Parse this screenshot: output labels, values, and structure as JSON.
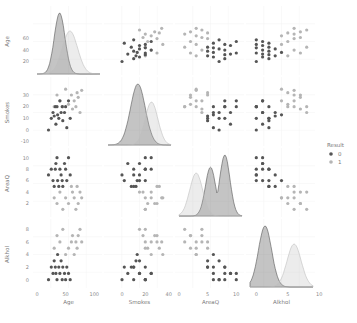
{
  "chart_data": {
    "type": "pairplot",
    "title": "",
    "variables": [
      "Age",
      "Smokes",
      "AreaQ",
      "Alkhol"
    ],
    "hue": "Result",
    "legend": {
      "title": "Result",
      "position": "right",
      "entries": [
        {
          "label": "0",
          "color": "#555555"
        },
        {
          "label": "1",
          "color": "#b5b5b5"
        }
      ]
    },
    "axes": {
      "Age": {
        "range": [
          0,
          110
        ],
        "ticks": [
          0,
          50,
          100
        ],
        "y_ticks": [
          20,
          40,
          60
        ]
      },
      "Smokes": {
        "range": [
          -12,
          42
        ],
        "ticks": [
          0,
          20,
          40
        ],
        "y_ticks": [
          -10,
          0,
          10,
          20,
          30
        ]
      },
      "AreaQ": {
        "range": [
          0,
          11
        ],
        "ticks": [
          0,
          5,
          10
        ],
        "y_ticks": [
          2,
          4,
          6,
          8,
          10
        ]
      },
      "Alkhol": {
        "range": [
          -1,
          9
        ],
        "ticks": [
          0,
          5,
          10
        ],
        "y_ticks": [
          0,
          2,
          4,
          6,
          8
        ]
      }
    },
    "grid": true,
    "diagonal": "kde",
    "offdiagonal": "scatter",
    "series": [
      {
        "name": "0",
        "points": [
          {
            "Age": 20,
            "Smokes": 0,
            "AreaQ": 7,
            "Alkhol": 0
          },
          {
            "Age": 25,
            "Smokes": 10,
            "AreaQ": 8,
            "Alkhol": 2
          },
          {
            "Age": 28,
            "Smokes": 15,
            "AreaQ": 6,
            "Alkhol": 1
          },
          {
            "Age": 30,
            "Smokes": 12,
            "AreaQ": 5,
            "Alkhol": 3
          },
          {
            "Age": 32,
            "Smokes": 20,
            "AreaQ": 8,
            "Alkhol": 2
          },
          {
            "Age": 33,
            "Smokes": 5,
            "AreaQ": 9,
            "Alkhol": 1
          },
          {
            "Age": 35,
            "Smokes": 20,
            "AreaQ": 10,
            "Alkhol": 0
          },
          {
            "Age": 36,
            "Smokes": 13,
            "AreaQ": 6,
            "Alkhol": 4
          },
          {
            "Age": 38,
            "Smokes": 10,
            "AreaQ": 5,
            "Alkhol": 2
          },
          {
            "Age": 40,
            "Smokes": 25,
            "AreaQ": 8,
            "Alkhol": 1
          },
          {
            "Age": 42,
            "Smokes": 15,
            "AreaQ": 7,
            "Alkhol": 3
          },
          {
            "Age": 44,
            "Smokes": 20,
            "AreaQ": 6,
            "Alkhol": 0
          },
          {
            "Age": 45,
            "Smokes": 8,
            "AreaQ": 5,
            "Alkhol": 2
          },
          {
            "Age": 48,
            "Smokes": 15,
            "AreaQ": 9,
            "Alkhol": 1
          },
          {
            "Age": 50,
            "Smokes": 20,
            "AreaQ": 8,
            "Alkhol": 0
          },
          {
            "Age": 52,
            "Smokes": 2,
            "AreaQ": 6,
            "Alkhol": 2
          },
          {
            "Age": 55,
            "Smokes": 25,
            "AreaQ": 10,
            "Alkhol": 1
          },
          {
            "Age": 58,
            "Smokes": 10,
            "AreaQ": 7,
            "Alkhol": 0
          }
        ]
      },
      {
        "name": "1",
        "points": [
          {
            "Age": 30,
            "Smokes": 20,
            "AreaQ": 3,
            "Alkhol": 5
          },
          {
            "Age": 35,
            "Smokes": 30,
            "AreaQ": 2,
            "Alkhol": 7
          },
          {
            "Age": 40,
            "Smokes": 25,
            "AreaQ": 4,
            "Alkhol": 6
          },
          {
            "Age": 45,
            "Smokes": 20,
            "AreaQ": 1,
            "Alkhol": 8
          },
          {
            "Age": 50,
            "Smokes": 35,
            "AreaQ": 3,
            "Alkhol": 4
          },
          {
            "Age": 55,
            "Smokes": 22,
            "AreaQ": 2,
            "Alkhol": 5
          },
          {
            "Age": 60,
            "Smokes": 30,
            "AreaQ": 5,
            "Alkhol": 6
          },
          {
            "Age": 62,
            "Smokes": 18,
            "AreaQ": 4,
            "Alkhol": 7
          },
          {
            "Age": 65,
            "Smokes": 25,
            "AreaQ": 3,
            "Alkhol": 4
          },
          {
            "Age": 68,
            "Smokes": 20,
            "AreaQ": 1,
            "Alkhol": 6
          },
          {
            "Age": 70,
            "Smokes": 32,
            "AreaQ": 5,
            "Alkhol": 5
          },
          {
            "Age": 72,
            "Smokes": 28,
            "AreaQ": 2,
            "Alkhol": 7
          },
          {
            "Age": 75,
            "Smokes": 15,
            "AreaQ": 4,
            "Alkhol": 8
          },
          {
            "Age": 78,
            "Smokes": 34,
            "AreaQ": 3,
            "Alkhol": 6
          }
        ]
      }
    ]
  },
  "labels": {
    "x": [
      "Age",
      "Smokes",
      "AreaQ",
      "Alkhol"
    ],
    "y": [
      "Age",
      "Smokes",
      "AreaQ",
      "Alkhol"
    ],
    "legend_title": "Result",
    "legend_0": "0",
    "legend_1": "1"
  }
}
